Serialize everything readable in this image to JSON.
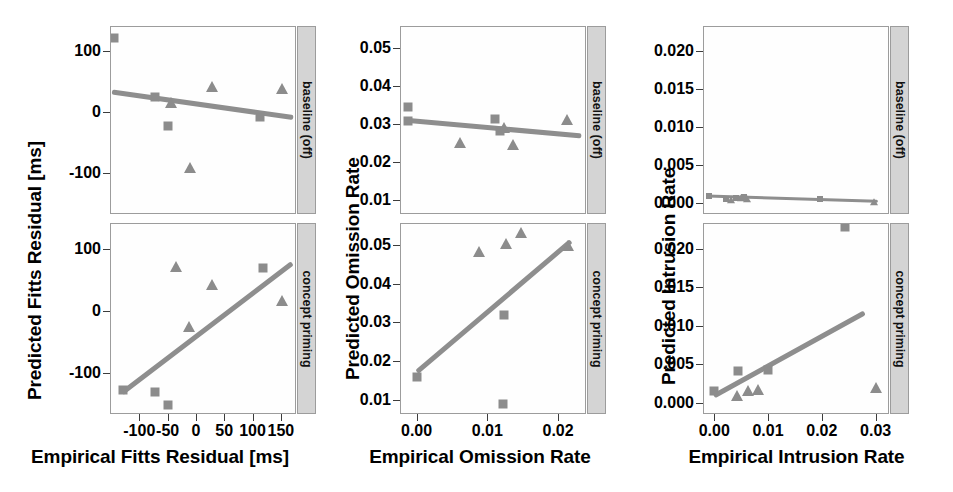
{
  "figure": {
    "rows": [
      {
        "id": "baseline",
        "strip_label": "baseline (off)"
      },
      {
        "id": "concept",
        "strip_label": "concept priming"
      }
    ],
    "marker_color": "#8c8c8c",
    "line_color": "#8e8e8e",
    "strip_bg": "#d4d4d4",
    "panel_border": "#9c9c9c"
  },
  "chart_data": [
    {
      "type": "scatter",
      "panel": "fitts-baseline",
      "title": "",
      "xlabel": "Empirical Fitts Residual [ms]",
      "ylabel": "Predicted Fitts Residual [ms]",
      "facet": "baseline (off)",
      "xlim": [
        -150,
        175
      ],
      "ylim": [
        -165,
        140
      ],
      "xticks": [
        -100,
        -50,
        0,
        50,
        100,
        150
      ],
      "xticklabels": [
        "-100",
        "-50",
        "0",
        "50",
        "100",
        "150"
      ],
      "yticks": [
        100,
        0,
        -100
      ],
      "yticklabels": [
        "100",
        "0",
        "-100"
      ],
      "grid": false,
      "legend": "none",
      "series": [
        {
          "name": "square",
          "marker": "square",
          "points": [
            [
              -145,
              122
            ],
            [
              -72,
              25
            ],
            [
              -50,
              -23
            ],
            [
              113,
              -7
            ]
          ]
        },
        {
          "name": "triangle",
          "marker": "triangle",
          "points": [
            [
              -44,
              16
            ],
            [
              -10,
              -92
            ],
            [
              29,
              42
            ],
            [
              152,
              39
            ]
          ]
        }
      ],
      "fit_line": {
        "x": [
          -148,
          172
        ],
        "y": [
          33,
          -9
        ]
      }
    },
    {
      "type": "scatter",
      "panel": "fitts-concept",
      "title": "",
      "xlabel": "Empirical Fitts Residual [ms]",
      "ylabel": "Predicted Fitts Residual [ms]",
      "facet": "concept priming",
      "xlim": [
        -150,
        175
      ],
      "ylim": [
        -165,
        140
      ],
      "xticks": [
        -100,
        -50,
        0,
        50,
        100,
        150
      ],
      "xticklabels": [
        "-100",
        "-50",
        "0",
        "50",
        "100",
        "150"
      ],
      "yticks": [
        100,
        0,
        -100
      ],
      "yticklabels": [
        "100",
        "0",
        "-100"
      ],
      "grid": false,
      "legend": "none",
      "series": [
        {
          "name": "square",
          "marker": "square",
          "points": [
            [
              -128,
              -128
            ],
            [
              -72,
              -131
            ],
            [
              -50,
              -152
            ],
            [
              118,
              69
            ]
          ]
        },
        {
          "name": "triangle",
          "marker": "triangle",
          "points": [
            [
              -36,
              70
            ],
            [
              -12,
              -27
            ],
            [
              29,
              41
            ],
            [
              152,
              15
            ]
          ]
        }
      ],
      "fit_line": {
        "x": [
          -130,
          170
        ],
        "y": [
          -133,
          76
        ]
      }
    },
    {
      "type": "scatter",
      "panel": "omission-baseline",
      "title": "",
      "xlabel": "Empirical Omission Rate",
      "ylabel": "Predicted Omission Rate",
      "facet": "baseline (off)",
      "xlim": [
        -0.0022,
        0.0238
      ],
      "ylim": [
        0.0065,
        0.0555
      ],
      "xticks": [
        0.0,
        0.01,
        0.02
      ],
      "xticklabels": [
        "0.00",
        "0.01",
        "0.02"
      ],
      "yticks": [
        0.05,
        0.04,
        0.03,
        0.02,
        0.01
      ],
      "yticklabels": [
        "0.05",
        "0.04",
        "0.03",
        "0.02",
        "0.01"
      ],
      "grid": false,
      "legend": "none",
      "series": [
        {
          "name": "square",
          "marker": "square",
          "points": [
            [
              -0.0012,
              0.0345
            ],
            [
              -0.0012,
              0.0308
            ],
            [
              0.0111,
              0.0312
            ],
            [
              0.0118,
              0.0282
            ]
          ]
        },
        {
          "name": "triangle",
          "marker": "triangle",
          "points": [
            [
              0.0062,
              0.0249
            ],
            [
              0.0123,
              0.0289
            ],
            [
              0.0136,
              0.0245
            ],
            [
              0.0213,
              0.031
            ]
          ]
        }
      ],
      "fit_line": {
        "x": [
          -0.0018,
          0.0232
        ],
        "y": [
          0.031,
          0.0268
        ]
      }
    },
    {
      "type": "scatter",
      "panel": "omission-concept",
      "title": "",
      "xlabel": "Empirical Omission Rate",
      "ylabel": "Predicted Omission Rate",
      "facet": "concept priming",
      "xlim": [
        -0.0022,
        0.0238
      ],
      "ylim": [
        0.0065,
        0.0555
      ],
      "xticks": [
        0.0,
        0.01,
        0.02
      ],
      "xticklabels": [
        "0.00",
        "0.01",
        "0.02"
      ],
      "yticks": [
        0.05,
        0.04,
        0.03,
        0.02,
        0.01
      ],
      "yticklabels": [
        "0.05",
        "0.04",
        "0.03",
        "0.02",
        "0.01"
      ],
      "grid": false,
      "legend": "none",
      "series": [
        {
          "name": "square",
          "marker": "square",
          "points": [
            [
              0.0,
              0.0159
            ],
            [
              0.0124,
              0.0318
            ],
            [
              0.0122,
              0.0088
            ]
          ]
        },
        {
          "name": "triangle",
          "marker": "triangle",
          "points": [
            [
              0.0088,
              0.0483
            ],
            [
              0.0127,
              0.0503
            ],
            [
              0.0148,
              0.0531
            ],
            [
              0.0214,
              0.0497
            ]
          ]
        }
      ],
      "fit_line": {
        "x": [
          0.0,
          0.0218
        ],
        "y": [
          0.0172,
          0.0512
        ]
      }
    },
    {
      "type": "scatter",
      "panel": "intrusion-baseline",
      "title": "",
      "xlabel": "Empirical Intrusion Rate",
      "ylabel": "Predicted Intrusion Rate",
      "facet": "baseline (off)",
      "xlim": [
        -0.0019,
        0.0323
      ],
      "ylim": [
        -0.0013,
        0.0232
      ],
      "xticks": [
        0.0,
        0.01,
        0.02,
        0.03
      ],
      "xticklabels": [
        "0.00",
        "0.01",
        "0.02",
        "0.03"
      ],
      "yticks": [
        0.02,
        0.015,
        0.01,
        0.005,
        0.0
      ],
      "yticklabels": [
        "0.020",
        "0.015",
        "0.010",
        "0.005",
        "0.000"
      ],
      "grid": false,
      "legend": "none",
      "series": [
        {
          "name": "square",
          "marker": "square",
          "points": [
            [
              -0.001,
              0.001
            ],
            [
              0.0021,
              0.0006
            ],
            [
              0.004,
              0.0007
            ],
            [
              0.0055,
              0.0008
            ],
            [
              0.0196,
              0.0006
            ]
          ]
        },
        {
          "name": "triangle",
          "marker": "triangle",
          "points": [
            [
              0.0032,
              0.0004
            ],
            [
              0.005,
              0.0007
            ],
            [
              0.006,
              0.0006
            ],
            [
              0.0297,
              0.0001
            ]
          ]
        }
      ],
      "fit_line": {
        "x": [
          -0.0015,
          0.0305
        ],
        "y": [
          0.0009,
          0.0002
        ]
      }
    },
    {
      "type": "scatter",
      "panel": "intrusion-concept",
      "title": "",
      "xlabel": "Empirical Intrusion Rate",
      "ylabel": "Predicted Intrusion Rate",
      "facet": "concept priming",
      "xlim": [
        -0.0019,
        0.0323
      ],
      "ylim": [
        -0.0013,
        0.0232
      ],
      "xticks": [
        0.0,
        0.01,
        0.02,
        0.03
      ],
      "xticklabels": [
        "0.00",
        "0.01",
        "0.02",
        "0.03"
      ],
      "yticks": [
        0.02,
        0.015,
        0.01,
        0.005,
        0.0
      ],
      "yticklabels": [
        "0.020",
        "0.015",
        "0.010",
        "0.005",
        "0.000"
      ],
      "grid": false,
      "legend": "none",
      "series": [
        {
          "name": "square",
          "marker": "square",
          "points": [
            [
              0.0,
              0.0016
            ],
            [
              0.0045,
              0.0042
            ],
            [
              0.01,
              0.0043
            ],
            [
              0.0243,
              0.0228
            ]
          ]
        },
        {
          "name": "triangle",
          "marker": "triangle",
          "points": [
            [
              0.0043,
              0.0009
            ],
            [
              0.0063,
              0.0016
            ],
            [
              0.0082,
              0.0017
            ],
            [
              0.03,
              0.002
            ]
          ]
        }
      ],
      "fit_line": {
        "x": [
          0.0,
          0.028
        ],
        "y": [
          0.0009,
          0.0117
        ]
      }
    }
  ]
}
